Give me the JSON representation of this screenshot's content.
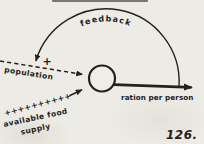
{
  "figure": {
    "number": "126."
  },
  "diagram": {
    "feedback_label": "feedback",
    "population_label": "population",
    "polarity_sign": "+",
    "plus_row": "++++++++++",
    "available_food_label": "available food",
    "supply_label": "supply",
    "ration_label": "ration per person"
  },
  "colors": {
    "ink": "#24211d",
    "paper": "#edebe5"
  }
}
